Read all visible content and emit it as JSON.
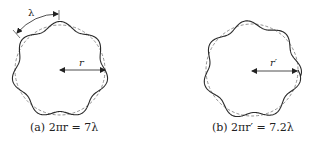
{
  "figures": [
    {
      "id": "a",
      "caption": "(a) 2πr = 7λ",
      "radius_label": "r",
      "wavelength_label": "λ",
      "waves": 7,
      "center": [
        60,
        70
      ],
      "radius": 45
    },
    {
      "id": "b",
      "caption": "(b) 2πr′ = 7.2λ",
      "radius_label": "r′",
      "waves": 7.2,
      "center": [
        252,
        70
      ],
      "radius": 46
    }
  ],
  "colors": {
    "wave": "#2a2a2a",
    "dashed": "#777777",
    "text": "#222222"
  }
}
